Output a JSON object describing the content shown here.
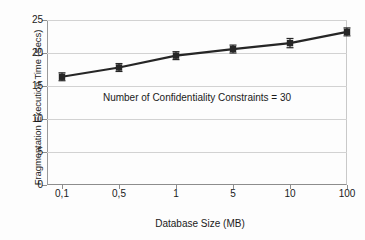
{
  "chart_data": {
    "type": "line",
    "title": "",
    "subtitle": "",
    "xlabel": "Database Size (MB)",
    "ylabel": "Fragmentation Execution Time (Secs)",
    "categories": [
      "0,1",
      "0,5",
      "1",
      "5",
      "10",
      "100"
    ],
    "values": [
      16.4,
      17.8,
      19.6,
      20.6,
      21.5,
      23.2
    ],
    "error_bars": [
      0.6,
      0.6,
      0.6,
      0.6,
      0.7,
      0.6
    ],
    "series": [
      {
        "name": "Fragmentation Execution Time",
        "values": [
          16.4,
          17.8,
          19.6,
          20.6,
          21.5,
          23.2
        ],
        "error": [
          0.6,
          0.6,
          0.6,
          0.6,
          0.7,
          0.6
        ],
        "color": "#262626",
        "marker": "square"
      }
    ],
    "ylim": [
      0,
      25
    ],
    "yticks": [
      0,
      5,
      10,
      15,
      20,
      25
    ],
    "ytick_labels": [
      "0",
      "5",
      "10",
      "15",
      "20",
      "25"
    ],
    "xtick_labels": [
      "0,1",
      "0,5",
      "1",
      "5",
      "10",
      "100"
    ],
    "grid": "horizontal",
    "legend": "none",
    "annotations": [
      {
        "text": "Number of Confidentiality Constraints = 30",
        "x_category": "1",
        "y_value": 13.2
      }
    ],
    "colors": {
      "line": "#262626",
      "marker": "#262626",
      "error_bar": "#262626",
      "grid": "#d2d2d2",
      "axis": "#8d8d8d",
      "text": "#1a1a1a",
      "background": "#fdfdfd"
    }
  }
}
